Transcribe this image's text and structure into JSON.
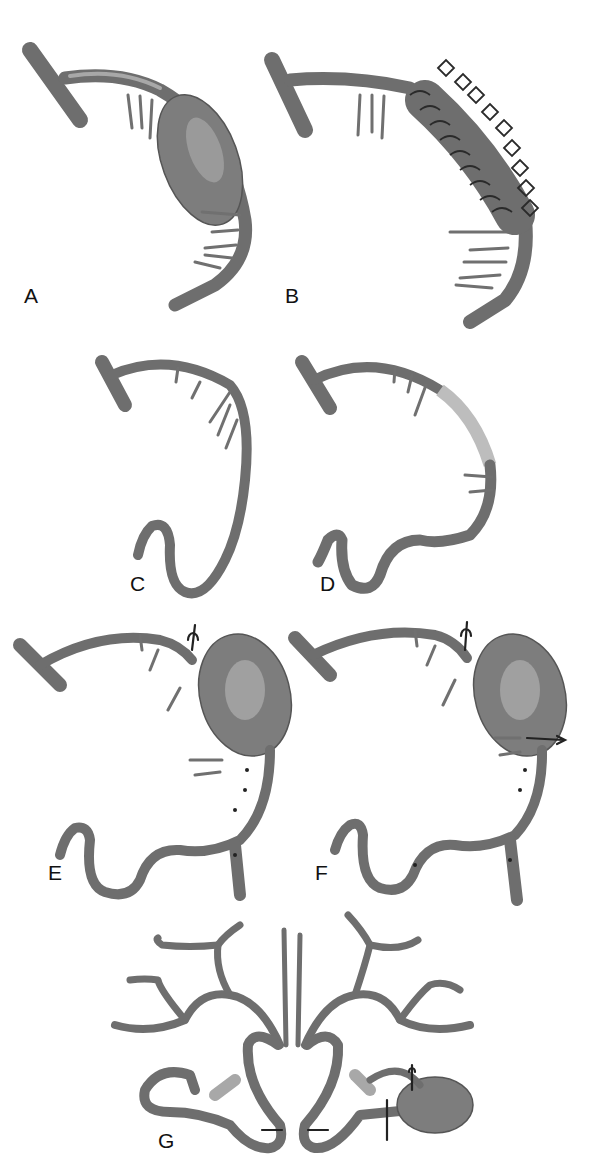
{
  "figure": {
    "panels": [
      {
        "id": "A",
        "label": "A",
        "content": "Fusiform aneurysm on arterial segment with perforating branches"
      },
      {
        "id": "B",
        "label": "B",
        "content": "Aneurysm wrapped/coiled with clip-like rings"
      },
      {
        "id": "C",
        "label": "C",
        "content": "Aneurysm excised with end-to-end reconstruction and bypass loop"
      },
      {
        "id": "D",
        "label": "D",
        "content": "Interposition graft replacing aneurysmal segment"
      },
      {
        "id": "E",
        "label": "E",
        "content": "Proximal clip occlusion with distal bypass anastomosis"
      },
      {
        "id": "F",
        "label": "F",
        "content": "Proximal and distal clip trapping with bypass"
      },
      {
        "id": "G",
        "label": "G",
        "content": "Circle of Willis view with side-to-side anastomosis and clipped aneurysm"
      }
    ]
  },
  "colors": {
    "background": "#ffffff",
    "vessel": "#6e6e6e",
    "vessel_highlight": "#a8a8a8",
    "label": "#111111"
  }
}
